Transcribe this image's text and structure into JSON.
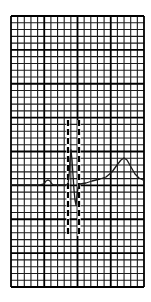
{
  "figure": {
    "type": "ecg-strip",
    "colors": {
      "background": "#ffffff",
      "grid_minor": "#1a1a1a",
      "grid_major": "#000000",
      "trace": "#1a1a1a",
      "markers": "#000000"
    }
  },
  "grid": {
    "left": 11,
    "top": 16,
    "right": 144,
    "bottom": 287,
    "minor_cols": 20,
    "minor_rows": 40,
    "major_every": 5
  },
  "trace": {
    "baseline_y": 185,
    "points": [
      [
        11,
        185
      ],
      [
        40,
        185
      ],
      [
        44,
        184
      ],
      [
        46,
        181
      ],
      [
        48,
        180
      ],
      [
        50,
        181
      ],
      [
        52,
        184
      ],
      [
        54,
        185
      ],
      [
        66,
        185
      ],
      [
        68,
        184
      ],
      [
        69,
        176
      ],
      [
        70,
        160
      ],
      [
        71,
        150
      ],
      [
        72,
        160
      ],
      [
        74,
        190
      ],
      [
        75,
        200
      ],
      [
        76,
        205
      ],
      [
        77,
        196
      ],
      [
        78,
        188
      ],
      [
        80,
        184
      ],
      [
        86,
        183
      ],
      [
        92,
        181
      ],
      [
        100,
        179
      ],
      [
        106,
        177
      ],
      [
        112,
        172
      ],
      [
        117,
        165
      ],
      [
        121,
        160
      ],
      [
        124,
        158
      ],
      [
        127,
        160
      ],
      [
        131,
        167
      ],
      [
        135,
        174
      ],
      [
        139,
        178
      ],
      [
        143,
        180
      ]
    ]
  },
  "markers": [
    {
      "x": 68,
      "y1": 120,
      "y2": 236,
      "style": "dashed"
    },
    {
      "x": 79,
      "y1": 120,
      "y2": 236,
      "style": "dashed"
    }
  ]
}
